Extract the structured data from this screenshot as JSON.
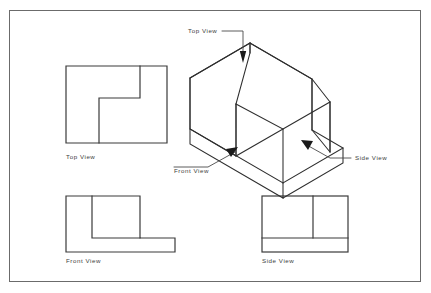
{
  "sheet": {
    "title": "Orthographic Projection Drawing",
    "background_color": "#ffffff",
    "border_color": "#6b6b6b",
    "line_color": "#3a3a3a"
  },
  "labels": {
    "top_view": "Top View",
    "front_view": "Front View",
    "side_view": "Side View",
    "iso_top_view": "Top View",
    "iso_front_view": "Front View",
    "iso_side_view": "Side View"
  },
  "views": {
    "top": {
      "name": "Top View",
      "label": "Top View",
      "outline_description": "rectangle with inner L-shaped step notch",
      "x": 66,
      "y": 66,
      "width": 101,
      "height": 77
    },
    "front": {
      "name": "Front View",
      "label": "Front View",
      "outline_description": "L-shaped profile with wide base flange",
      "x": 66,
      "y": 196,
      "width": 109,
      "height": 56
    },
    "side": {
      "name": "Side View",
      "label": "Side View",
      "outline_description": "rectangle divided by one vertical and one horizontal line",
      "x": 262,
      "y": 196,
      "width": 86,
      "height": 56
    },
    "isometric": {
      "name": "Isometric View",
      "description": "L-shaped block with two upright walls on a base slab"
    }
  },
  "callouts": [
    {
      "name": "top-view-callout",
      "label": "Top View",
      "direction": "down"
    },
    {
      "name": "front-view-callout",
      "label": "Front View",
      "direction": "up-right"
    },
    {
      "name": "side-view-callout",
      "label": "Side View",
      "direction": "up-left"
    }
  ]
}
